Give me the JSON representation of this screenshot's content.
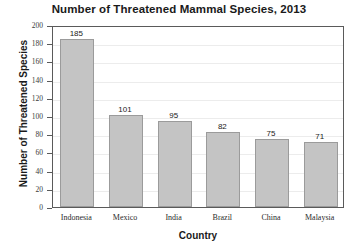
{
  "chart_data": {
    "type": "bar",
    "title": "Number of Threatened Mammal Species, 2013",
    "xlabel": "Country",
    "ylabel": "Number of Threatened Species",
    "categories": [
      "Indonesia",
      "Mexico",
      "India",
      "Brazil",
      "China",
      "Malaysia"
    ],
    "values": [
      185,
      101,
      95,
      82,
      75,
      71
    ],
    "value_labels": [
      "185",
      "101",
      "95",
      "82",
      "75",
      "71"
    ],
    "ylim": [
      0,
      200
    ],
    "ytick_step": 20,
    "yticks": [
      0,
      20,
      40,
      60,
      80,
      100,
      120,
      140,
      160,
      180,
      200
    ],
    "ytick_labels": [
      "0",
      "20",
      "40",
      "60",
      "80",
      "100",
      "120",
      "140",
      "160",
      "180",
      "200"
    ],
    "grid": true,
    "legend": null,
    "bar_color": "#c4c4c4",
    "bar_border_color": "#9b9b9b",
    "axis_color": "#5a5a5a",
    "grid_color": "#ececec"
  }
}
